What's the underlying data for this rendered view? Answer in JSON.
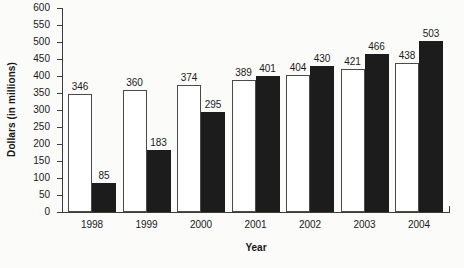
{
  "chart_data": {
    "type": "bar",
    "title": "",
    "xlabel": "Year",
    "ylabel": "Dollars (in millions)",
    "categories": [
      "1998",
      "1999",
      "2000",
      "2001",
      "2002",
      "2003",
      "2004"
    ],
    "ylim": [
      0,
      600
    ],
    "yticks": [
      0,
      50,
      100,
      150,
      200,
      250,
      300,
      350,
      400,
      450,
      500,
      550,
      600
    ],
    "ytick_labels": [
      "0",
      "50",
      "100",
      "150",
      "200",
      "250",
      "300",
      "350",
      "400",
      "450",
      "500",
      "550",
      "600"
    ],
    "grid": false,
    "legend": "none",
    "series": [
      {
        "name": "open-bar",
        "fill": "#ffffff",
        "edge": "#4a4a4a",
        "values": [
          346,
          360,
          374,
          389,
          404,
          421,
          438
        ]
      },
      {
        "name": "filled-bar",
        "fill": "#1c1c1c",
        "edge": "#1c1c1c",
        "values": [
          85,
          183,
          295,
          401,
          430,
          466,
          503
        ]
      }
    ]
  },
  "colors": {
    "background": "#fbfbf9",
    "axis": "#3b3b3b",
    "text": "#1a1a1a",
    "open_bar": "#ffffff",
    "filled_bar": "#1c1c1c"
  }
}
